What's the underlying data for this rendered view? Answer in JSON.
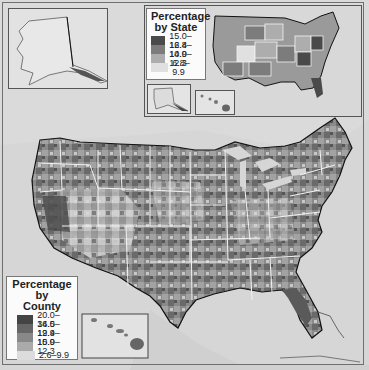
{
  "map": {
    "subject": "Percentage of population (United States)",
    "projection_area": "Contiguous United States with Alaska and Hawaii insets",
    "colors": {
      "background_water": "#d6d6d6",
      "land_light": "#e6e6e6",
      "state_border": "#f5f5f5",
      "national_border": "#111111"
    }
  },
  "state_legend": {
    "title_line1": "Percentage",
    "title_line2": "by State",
    "items": [
      {
        "label": "15.0–16.8",
        "color": "#4a4a4a"
      },
      {
        "label": "12.4–14.9",
        "color": "#7c7c7c"
      },
      {
        "label": "10.0–12.3",
        "color": "#adadad"
      },
      {
        "label": "6.8–9.9",
        "color": "#e0e0e0"
      }
    ]
  },
  "county_legend": {
    "title_line1": "Percentage by",
    "title_line2": "County",
    "items": [
      {
        "label": "20.0–34.5",
        "color": "#444444"
      },
      {
        "label": "16.0–19.9",
        "color": "#666666"
      },
      {
        "label": "12.4–15.9",
        "color": "#888888"
      },
      {
        "label": "10.0–12.3",
        "color": "#aaaaaa"
      },
      {
        "label": "2.6–9.9",
        "color": "#dcdcdc"
      }
    ]
  },
  "insets": {
    "alaska_main": "Alaska inset",
    "state_map": "Percentage by State inset map",
    "state_alaska": "Alaska (state inset)",
    "state_hawaii": "Hawaii (state inset)",
    "hawaii_main": "Hawaii inset"
  }
}
